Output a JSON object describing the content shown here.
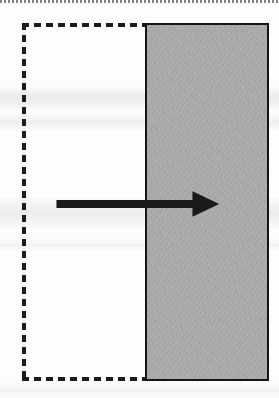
{
  "figure": {
    "title": "Displacement of a rectangular region",
    "background_color": "#fdfdfd",
    "shapes": {
      "dashed_rect": {
        "name": "reference-region",
        "style": "dashed",
        "stroke_color": "#1b1b1b",
        "fill": "none",
        "x": 22,
        "y": 23,
        "width": 247,
        "height": 358,
        "dash_length": 7,
        "gap_length": 5
      },
      "solid_rect": {
        "name": "displaced-region",
        "style": "solid",
        "stroke_color": "#151515",
        "fill_color": "#a9a9a9",
        "stroke_width": 2.5,
        "x": 145,
        "y": 23,
        "width": 124,
        "height": 358
      },
      "arrow": {
        "name": "direction-arrow",
        "color": "#1a1a1a",
        "direction": "right",
        "tail_x": 57,
        "tip_x": 218,
        "center_y": 204,
        "shaft_thickness": 7,
        "head_length": 25,
        "head_half_width": 12
      }
    },
    "artifacts": {
      "page_edge_line": "dotted-scan-edge",
      "scan_bands": 5
    }
  }
}
